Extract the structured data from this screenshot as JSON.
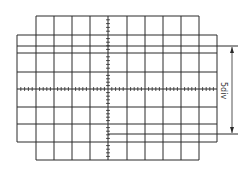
{
  "diagram": {
    "colors": {
      "line": "#2a2a2a",
      "background": "#ffffff",
      "text": "#333333"
    },
    "graticule": {
      "outer_left": 17,
      "outer_right": 217,
      "inner_left": 36,
      "inner_right": 199,
      "top": 16,
      "bottom": 160,
      "wide_top": 35,
      "wide_bottom": 142,
      "vertical_lines_x": [
        17,
        36,
        54,
        72,
        90,
        108,
        127,
        145,
        163,
        181,
        199,
        217
      ],
      "horizontal_lines_y": [
        16,
        35,
        53,
        72,
        89,
        107,
        124,
        142,
        160
      ],
      "center_x": 108,
      "center_y": 89,
      "minor_ticks_per_division": 4
    },
    "traces": [
      {
        "name": "upper-trace",
        "x1": 17,
        "x2": 238,
        "y": 46
      },
      {
        "name": "lower-trace",
        "x1": 108,
        "x2": 238,
        "y": 134
      }
    ],
    "measurement": {
      "label": "5div",
      "arrow_x": 232,
      "y_top": 46,
      "y_bottom": 134,
      "orientation": "vertical-double-arrow"
    }
  }
}
